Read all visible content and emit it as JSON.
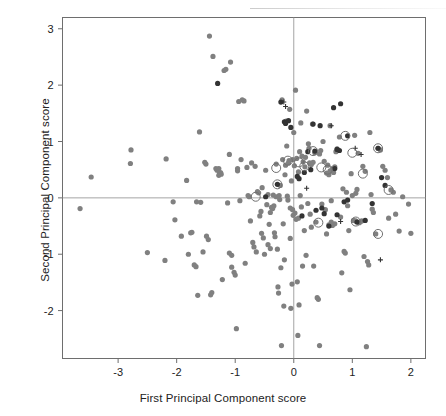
{
  "figure": {
    "width": 446,
    "height": 416,
    "background": "#ffffff"
  },
  "axes": {
    "x_title": "First Principal Component score",
    "y_title": "Second Principal Component score",
    "frame_color": "#6e6e6e",
    "reference_line_color": "#9a9a9a",
    "tick_color": "#6e6e6e",
    "label_color": "#222222"
  },
  "colors": {
    "point_gray": "#808080",
    "point_dark": "#333333",
    "ring": "#6f6f6f",
    "plus": "#333333"
  },
  "chart_data": {
    "type": "scatter",
    "title": "",
    "xlabel": "First Principal Component score",
    "ylabel": "Second Principal Component score",
    "xlim": [
      -3.95,
      2.25
    ],
    "ylim": [
      -2.85,
      3.2
    ],
    "xticks": [
      -3,
      -2,
      -1,
      0,
      1,
      2
    ],
    "xticklabels": [
      "-3",
      "-2",
      "-1",
      "0",
      "1",
      "2"
    ],
    "yticks": [
      -2,
      -1,
      0,
      1,
      2,
      3
    ],
    "yticklabels": [
      "-2",
      "-1",
      "0",
      "1",
      "2",
      "3"
    ],
    "grid": false,
    "reference_lines": {
      "hline_y": 0,
      "vline_x": 0
    },
    "legend": null,
    "series": [
      {
        "name": "gray-filled-circles",
        "marker": "filled-circle",
        "color": "#808080",
        "size": 5.2,
        "points": [
          [
            -3.65,
            -0.19
          ],
          [
            -3.46,
            0.37
          ],
          [
            -2.78,
            0.85
          ],
          [
            -2.79,
            0.61
          ],
          [
            -2.5,
            -0.97
          ],
          [
            -2.18,
            0.69
          ],
          [
            -2.2,
            -1.11
          ],
          [
            -2.06,
            -0.07
          ],
          [
            -2.03,
            -0.39
          ],
          [
            -1.92,
            -0.68
          ],
          [
            -1.83,
            0.31
          ],
          [
            -1.8,
            -1.0
          ],
          [
            -1.76,
            -0.62
          ],
          [
            -1.74,
            -0.61
          ],
          [
            -1.7,
            -1.19
          ],
          [
            -1.67,
            -1.22
          ],
          [
            -1.66,
            -0.07
          ],
          [
            -1.64,
            -1.73
          ],
          [
            -1.61,
            1.17
          ],
          [
            -1.59,
            -0.08
          ],
          [
            -1.55,
            -0.96
          ],
          [
            -1.52,
            0.63
          ],
          [
            -1.5,
            0.6
          ],
          [
            -1.49,
            -0.68
          ],
          [
            -1.46,
            -0.74
          ],
          [
            -1.44,
            2.87
          ],
          [
            -1.42,
            -1.72
          ],
          [
            -1.4,
            -1.68
          ],
          [
            -1.38,
            2.51
          ],
          [
            -1.33,
            0.52
          ],
          [
            -1.31,
            0.49
          ],
          [
            -1.28,
            0.52
          ],
          [
            -1.27,
            0.44
          ],
          [
            -1.25,
            0.45
          ],
          [
            -1.22,
            -1.45
          ],
          [
            -1.19,
            2.26
          ],
          [
            -1.16,
            2.28
          ],
          [
            -1.13,
            -0.09
          ],
          [
            -1.1,
            0.77
          ],
          [
            -1.08,
            2.41
          ],
          [
            -1.06,
            -1.23
          ],
          [
            -1.02,
            -1.32
          ],
          [
            -1.0,
            -1.37
          ],
          [
            -0.98,
            -2.32
          ],
          [
            -0.96,
            0.52
          ],
          [
            -0.94,
            1.71
          ],
          [
            -0.92,
            -0.05
          ],
          [
            -0.9,
            0.68
          ],
          [
            -0.88,
            1.74
          ],
          [
            -0.85,
            1.72
          ],
          [
            -0.83,
            -1.16
          ],
          [
            -0.8,
            0.54
          ],
          [
            -0.78,
            0.04
          ],
          [
            -0.76,
            0.02
          ],
          [
            -0.74,
            -0.41
          ],
          [
            -0.72,
            0.62
          ],
          [
            -0.7,
            -0.79
          ],
          [
            -0.68,
            -0.87
          ],
          [
            -0.66,
            0.56
          ],
          [
            -0.64,
            -0.96
          ],
          [
            -0.62,
            0.11
          ],
          [
            -0.6,
            0.09
          ],
          [
            -0.58,
            -0.32
          ],
          [
            -0.56,
            -0.24
          ],
          [
            -0.54,
            0.18
          ],
          [
            -0.52,
            -0.71
          ],
          [
            -0.5,
            -1.0
          ],
          [
            -0.48,
            0.49
          ],
          [
            -0.46,
            -0.12
          ],
          [
            -0.44,
            0.06
          ],
          [
            -0.42,
            -0.47
          ],
          [
            -0.4,
            -0.26
          ],
          [
            -0.38,
            -0.17
          ],
          [
            -0.36,
            -0.19
          ],
          [
            -0.34,
            -0.14
          ],
          [
            -0.33,
            -0.62
          ],
          [
            -0.32,
            -0.69
          ],
          [
            -0.3,
            0.6
          ],
          [
            -0.28,
            -0.91
          ],
          [
            -0.27,
            -1.58
          ],
          [
            -0.26,
            -1.69
          ],
          [
            -0.25,
            0.04
          ],
          [
            -0.24,
            -0.03
          ],
          [
            -0.23,
            0.22
          ],
          [
            -0.22,
            -1.24
          ],
          [
            -0.21,
            -2.62
          ],
          [
            -0.2,
            1.74
          ],
          [
            -0.19,
            0.68
          ],
          [
            -0.18,
            -0.46
          ],
          [
            -0.17,
            -1.92
          ],
          [
            -0.16,
            -1.1
          ],
          [
            -0.15,
            0.41
          ],
          [
            -0.14,
            0.58
          ],
          [
            -0.13,
            1.36
          ],
          [
            -0.12,
            0.92
          ],
          [
            -0.11,
            0.03
          ],
          [
            -0.1,
            -0.04
          ],
          [
            -0.09,
            0.62
          ],
          [
            -0.08,
            0.66
          ],
          [
            -0.07,
            1.57
          ],
          [
            -0.06,
            -0.72
          ],
          [
            -0.05,
            -1.96
          ],
          [
            -0.04,
            0.3
          ],
          [
            -0.03,
            -1.53
          ],
          [
            -0.02,
            0.68
          ],
          [
            -0.01,
            -0.31
          ],
          [
            0.0,
            1.16
          ],
          [
            0.01,
            0.57
          ],
          [
            0.02,
            -0.27
          ],
          [
            0.03,
            1.91
          ],
          [
            0.04,
            -0.38
          ],
          [
            0.05,
            0.7
          ],
          [
            0.06,
            -1.49
          ],
          [
            0.07,
            -2.44
          ],
          [
            0.08,
            0.46
          ],
          [
            0.09,
            -1.9
          ],
          [
            0.1,
            0.82
          ],
          [
            0.11,
            0.04
          ],
          [
            0.12,
            1.33
          ],
          [
            0.13,
            -0.16
          ],
          [
            0.15,
            -1.21
          ],
          [
            0.16,
            0.64
          ],
          [
            0.18,
            -0.58
          ],
          [
            0.19,
            0.55
          ],
          [
            0.21,
            -1.02
          ],
          [
            0.22,
            1.54
          ],
          [
            0.24,
            -0.1
          ],
          [
            0.25,
            0.96
          ],
          [
            0.27,
            0.62
          ],
          [
            0.28,
            -0.29
          ],
          [
            0.3,
            -0.52
          ],
          [
            0.32,
            1.31
          ],
          [
            0.34,
            -1.21
          ],
          [
            0.36,
            0.8
          ],
          [
            0.38,
            -0.43
          ],
          [
            0.4,
            -1.77
          ],
          [
            0.42,
            -1.8
          ],
          [
            0.44,
            -2.62
          ],
          [
            0.46,
            0.84
          ],
          [
            0.48,
            -0.11
          ],
          [
            0.5,
            1.0
          ],
          [
            0.52,
            0.65
          ],
          [
            0.54,
            -0.21
          ],
          [
            0.56,
            -0.64
          ],
          [
            0.58,
            0.58
          ],
          [
            0.6,
            -0.48
          ],
          [
            0.62,
            1.28
          ],
          [
            0.64,
            -0.05
          ],
          [
            0.66,
            0.52
          ],
          [
            0.68,
            0.45
          ],
          [
            0.7,
            0.55
          ],
          [
            0.72,
            0.82
          ],
          [
            0.74,
            0.87
          ],
          [
            0.76,
            0.84
          ],
          [
            0.78,
            1.08
          ],
          [
            0.8,
            -0.34
          ],
          [
            0.82,
            -1.33
          ],
          [
            0.84,
            0.16
          ],
          [
            0.86,
            -0.95
          ],
          [
            0.88,
            -0.98
          ],
          [
            0.9,
            0.1
          ],
          [
            0.92,
            -0.14
          ],
          [
            0.94,
            -0.58
          ],
          [
            0.96,
            -1.63
          ],
          [
            0.98,
            0.43
          ],
          [
            1.0,
            0.04
          ],
          [
            1.02,
            -0.4
          ],
          [
            1.04,
            1.11
          ],
          [
            1.06,
            0.08
          ],
          [
            1.08,
            0.15
          ],
          [
            1.1,
            0.79
          ],
          [
            1.12,
            -0.44
          ],
          [
            1.14,
            -0.42
          ],
          [
            1.16,
            -0.41
          ],
          [
            1.18,
            0.56
          ],
          [
            1.2,
            -1.04
          ],
          [
            1.22,
            0.47
          ],
          [
            1.24,
            -2.64
          ],
          [
            1.26,
            -1.13
          ],
          [
            1.28,
            -1.19
          ],
          [
            1.3,
            1.16
          ],
          [
            1.32,
            0.06
          ],
          [
            1.34,
            -0.2
          ],
          [
            1.36,
            -0.26
          ],
          [
            1.4,
            -0.64
          ],
          [
            1.44,
            0.88
          ],
          [
            1.48,
            0.85
          ],
          [
            1.52,
            0.56
          ],
          [
            1.56,
            0.49
          ],
          [
            1.6,
            0.36
          ],
          [
            1.62,
            -0.36
          ],
          [
            1.66,
            0.14
          ],
          [
            1.7,
            0.1
          ],
          [
            1.74,
            -0.29
          ],
          [
            1.8,
            -0.59
          ],
          [
            1.86,
            0.02
          ],
          [
            1.96,
            -0.11
          ],
          [
            2.0,
            -0.63
          ],
          [
            -0.3,
            0.02
          ],
          [
            -0.35,
            0.05
          ],
          [
            0.64,
            -0.43
          ],
          [
            0.7,
            -0.46
          ],
          [
            0.66,
            -0.49
          ],
          [
            1.06,
            -0.41
          ],
          [
            0.3,
            0.59
          ],
          [
            0.33,
            0.63
          ],
          [
            0.56,
            0.44
          ],
          [
            0.6,
            0.41
          ],
          [
            0.62,
            0.48
          ],
          [
            -1.28,
            0.4
          ],
          [
            -1.24,
            0.42
          ],
          [
            -0.96,
            0.48
          ],
          [
            0.26,
            0.88
          ],
          [
            0.44,
            0.78
          ],
          [
            0.2,
            0.72
          ],
          [
            0.14,
            0.74
          ],
          [
            -0.02,
            -0.21
          ],
          [
            -0.06,
            -0.18
          ],
          [
            0.08,
            -0.36
          ],
          [
            -0.55,
            -0.63
          ],
          [
            -0.44,
            -0.83
          ],
          [
            -0.4,
            -0.9
          ],
          [
            -1.1,
            -0.98
          ],
          [
            -1.06,
            -1.02
          ]
        ]
      },
      {
        "name": "dark-filled-circles",
        "marker": "filled-circle",
        "color": "#333333",
        "size": 5.2,
        "points": [
          [
            -1.3,
            2.03
          ],
          [
            -0.22,
            1.7
          ],
          [
            -0.16,
            1.35
          ],
          [
            -0.14,
            1.32
          ],
          [
            -0.05,
            1.25
          ],
          [
            0.33,
            1.31
          ],
          [
            0.45,
            1.28
          ],
          [
            0.68,
            1.6
          ],
          [
            0.8,
            1.67
          ],
          [
            0.36,
            0.83
          ],
          [
            0.74,
            0.86
          ],
          [
            0.78,
            0.84
          ],
          [
            0.06,
            0.38
          ],
          [
            0.09,
            0.34
          ],
          [
            0.24,
            0.82
          ],
          [
            0.52,
            -0.28
          ],
          [
            0.74,
            -0.3
          ],
          [
            0.86,
            -0.07
          ],
          [
            0.92,
            -0.04
          ],
          [
            1.34,
            -0.1
          ],
          [
            1.22,
            -0.4
          ],
          [
            1.5,
            0.36
          ],
          [
            1.56,
            0.22
          ],
          [
            1.08,
            -0.43
          ],
          [
            -0.28,
            0.24
          ],
          [
            0.18,
            0.45
          ],
          [
            0.29,
            0.5
          ],
          [
            0.6,
            -0.5
          ],
          [
            0.48,
            -0.18
          ],
          [
            0.38,
            -0.22
          ],
          [
            0.14,
            -0.32
          ],
          [
            -0.48,
            0.02
          ],
          [
            1.44,
            0.88
          ],
          [
            0.92,
            1.1
          ],
          [
            0.7,
            0.52
          ],
          [
            -0.09,
            1.37
          ]
        ]
      },
      {
        "name": "plus-markers",
        "marker": "plus",
        "color": "#333333",
        "size": 5,
        "points": [
          [
            -0.17,
            1.7
          ],
          [
            -0.14,
            1.62
          ],
          [
            0.64,
            1.28
          ],
          [
            1.05,
            0.88
          ],
          [
            1.15,
            0.77
          ],
          [
            0.22,
            0.17
          ],
          [
            0.8,
            -0.42
          ],
          [
            1.48,
            -1.1
          ]
        ]
      },
      {
        "name": "ringed-points",
        "marker": "open-circle",
        "color": "#6f6f6f",
        "size": 9,
        "points": [
          [
            -0.3,
            0.53
          ],
          [
            -0.28,
            0.24
          ],
          [
            -0.65,
            0.02
          ],
          [
            -0.1,
            0.66
          ],
          [
            0.09,
            0.63
          ],
          [
            0.18,
            0.56
          ],
          [
            0.33,
            0.83
          ],
          [
            0.47,
            0.54
          ],
          [
            0.58,
            0.5
          ],
          [
            0.88,
            1.1
          ],
          [
            1.0,
            0.8
          ],
          [
            1.44,
            0.88
          ],
          [
            1.18,
            0.43
          ],
          [
            1.62,
            0.14
          ],
          [
            1.06,
            -0.42
          ],
          [
            1.44,
            -0.64
          ],
          [
            0.42,
            -0.44
          ]
        ]
      }
    ]
  }
}
